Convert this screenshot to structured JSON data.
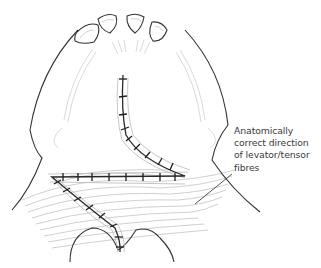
{
  "figure": {
    "annotation": {
      "lines": [
        "Anatomically",
        "correct direction",
        "of levator/tensor",
        "fibres"
      ]
    },
    "colors": {
      "outline": "#333333",
      "fibres": "#bdbdbd",
      "label_text": "#3a3a3a",
      "background": "#ffffff"
    }
  }
}
